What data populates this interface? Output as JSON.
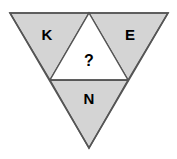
{
  "figure": {
    "background_color": "#ffffff",
    "fill_color": "#d4d4d4",
    "outline_color": "#555555",
    "empty_fill_color": "#ffffff",
    "text_color": "#000000",
    "outer_triangle": {
      "orientation": "down",
      "top_left": "10,13",
      "top_right": "168,13",
      "bottom": "89,148"
    },
    "midline": {
      "left": "50,80",
      "right": "128,80"
    },
    "cells": [
      {
        "id": "upper-left",
        "label": "K",
        "orientation": "down",
        "filled": true,
        "points": "10,13 89,13 50,80",
        "label_x": 47,
        "label_y": 35
      },
      {
        "id": "center",
        "label": "?",
        "orientation": "up",
        "filled": false,
        "points": "89,13 128,80 50,80",
        "label_x": 89,
        "label_y": 61
      },
      {
        "id": "upper-right",
        "label": "E",
        "orientation": "down",
        "filled": true,
        "points": "89,13 168,13 128,80",
        "label_x": 130,
        "label_y": 35
      },
      {
        "id": "bottom",
        "label": "N",
        "orientation": "down",
        "filled": true,
        "points": "50,80 128,80 89,148",
        "label_x": 89,
        "label_y": 99
      }
    ]
  }
}
